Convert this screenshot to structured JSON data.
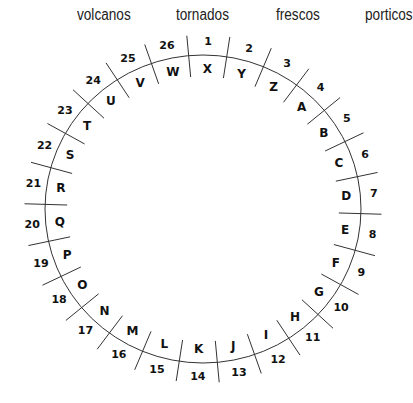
{
  "words": [
    {
      "text": "volcanos",
      "x": 77
    },
    {
      "text": "tornados",
      "x": 176
    },
    {
      "text": "frescos",
      "x": 276
    },
    {
      "text": "porticos",
      "x": 365
    }
  ],
  "wheel": {
    "cx": 203,
    "cy": 209,
    "rx": 158,
    "ry": 154,
    "segments": [
      {
        "number": "1",
        "letter": "X"
      },
      {
        "number": "2",
        "letter": "Y"
      },
      {
        "number": "3",
        "letter": "Z"
      },
      {
        "number": "4",
        "letter": "A"
      },
      {
        "number": "5",
        "letter": "B"
      },
      {
        "number": "6",
        "letter": "C"
      },
      {
        "number": "7",
        "letter": "D"
      },
      {
        "number": "8",
        "letter": "E"
      },
      {
        "number": "9",
        "letter": "F"
      },
      {
        "number": "10",
        "letter": "G"
      },
      {
        "number": "11",
        "letter": "H"
      },
      {
        "number": "12",
        "letter": "I"
      },
      {
        "number": "13",
        "letter": "J"
      },
      {
        "number": "14",
        "letter": "K"
      },
      {
        "number": "15",
        "letter": "L"
      },
      {
        "number": "16",
        "letter": "M"
      },
      {
        "number": "17",
        "letter": "N"
      },
      {
        "number": "18",
        "letter": "O"
      },
      {
        "number": "19",
        "letter": "P"
      },
      {
        "number": "20",
        "letter": "Q"
      },
      {
        "number": "21",
        "letter": "R"
      },
      {
        "number": "22",
        "letter": "S"
      },
      {
        "number": "23",
        "letter": "T"
      },
      {
        "number": "24",
        "letter": "U"
      },
      {
        "number": "25",
        "letter": "V"
      },
      {
        "number": "26",
        "letter": "W"
      }
    ]
  }
}
